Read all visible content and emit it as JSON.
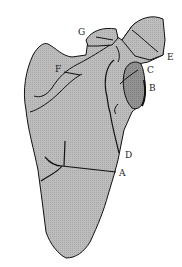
{
  "diagram": {
    "colors": {
      "bone_fill": "#b9b9b9",
      "glenoid_fill": "#8e8e8e",
      "outline": "#111111",
      "background": "#ffffff"
    },
    "labels": [
      {
        "id": "A",
        "text": "A"
      },
      {
        "id": "B",
        "text": "B"
      },
      {
        "id": "C",
        "text": "C"
      },
      {
        "id": "D",
        "text": "D"
      },
      {
        "id": "E",
        "text": "E"
      },
      {
        "id": "F",
        "text": "F"
      },
      {
        "id": "G",
        "text": "G"
      }
    ]
  }
}
